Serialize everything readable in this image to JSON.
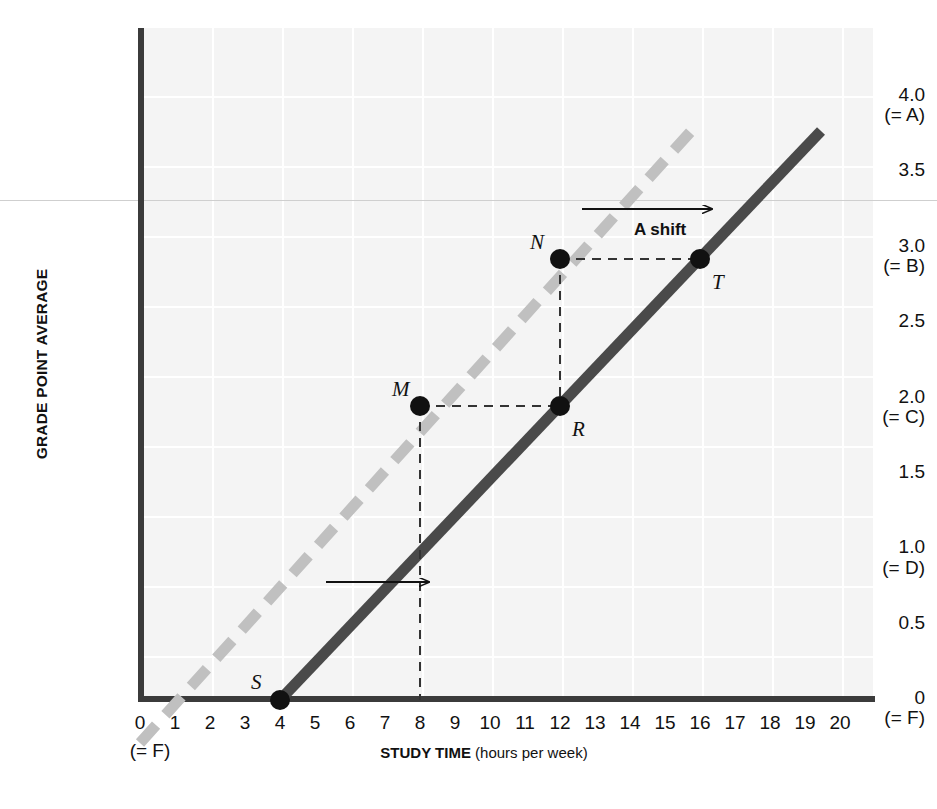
{
  "chart_data": {
    "type": "line",
    "title": "",
    "xlabel_strong": "STUDY TIME",
    "xlabel_rest": " (hours per week)",
    "ylabel": "GRADE POINT AVERAGE",
    "xlim": [
      0,
      21
    ],
    "ylim": [
      0,
      4.15
    ],
    "grid": true,
    "legend": "none",
    "x_ticks": [
      "0",
      "1",
      "2",
      "3",
      "4",
      "5",
      "6",
      "7",
      "8",
      "9",
      "10",
      "11",
      "12",
      "13",
      "14",
      "15",
      "16",
      "17",
      "18",
      "19",
      "20"
    ],
    "x_tick_sub": "(= F)",
    "y_ticks": [
      {
        "value": 4.0,
        "label": "4.0",
        "sub": "(= A)"
      },
      {
        "value": 3.5,
        "label": "3.5",
        "sub": ""
      },
      {
        "value": 3.0,
        "label": "3.0",
        "sub": "(= B)"
      },
      {
        "value": 2.5,
        "label": "2.5",
        "sub": ""
      },
      {
        "value": 2.0,
        "label": "2.0",
        "sub": "(= C)"
      },
      {
        "value": 1.5,
        "label": "1.5",
        "sub": ""
      },
      {
        "value": 1.0,
        "label": "1.0",
        "sub": "(= D)"
      },
      {
        "value": 0.5,
        "label": "0.5",
        "sub": ""
      },
      {
        "value": 0.0,
        "label": "0",
        "sub": "(= F)"
      }
    ],
    "series": [
      {
        "name": "original-curve",
        "style": "dashed",
        "color": "#c0c0c0",
        "x": [
          0.0,
          15.8
        ],
        "y": [
          -0.25,
          3.95
        ],
        "note": "original grade-study relationship, dashed light grey"
      },
      {
        "name": "shifted-curve",
        "style": "solid",
        "color": "#4a4a4a",
        "x": [
          4.0,
          20.0
        ],
        "y": [
          0.0,
          3.88
        ],
        "note": "shifted-right grade-study relationship, solid dark grey"
      }
    ],
    "points": [
      {
        "label": "M",
        "x": 8,
        "y": 1.93,
        "label_pos": "upper-left",
        "on": "original-curve"
      },
      {
        "label": "N",
        "x": 12,
        "y": 3.0,
        "label_pos": "upper-left",
        "on": "original-curve"
      },
      {
        "label": "R",
        "x": 12,
        "y": 1.93,
        "label_pos": "lower-right",
        "on": "shifted-curve"
      },
      {
        "label": "S",
        "x": 4,
        "y": 0.0,
        "label_pos": "upper-left",
        "on": "shifted-curve"
      },
      {
        "label": "T",
        "x": 16,
        "y": 3.0,
        "label_pos": "lower-right",
        "on": "shifted-curve"
      }
    ],
    "annotations": [
      {
        "name": "shift-label",
        "text": "A shift",
        "x": 14.2,
        "y": 3.3
      },
      {
        "name": "shift-arrow-upper",
        "from_x": 12.6,
        "from_y": 3.45,
        "to_x": 16.3,
        "to_y": 3.45
      },
      {
        "name": "shift-arrow-lower",
        "from_x": 5.3,
        "from_y": 0.78,
        "to_x": 8.2,
        "to_y": 0.78
      }
    ],
    "guide_lines": [
      {
        "name": "m-to-r-horizontal",
        "from_x": 8,
        "from_y": 1.93,
        "to_x": 12,
        "to_y": 1.93
      },
      {
        "name": "m-vertical-to-axis",
        "from_x": 8,
        "from_y": 1.93,
        "to_x": 8,
        "to_y": 0.0
      },
      {
        "name": "n-to-t-horizontal",
        "from_x": 12,
        "from_y": 3.0,
        "to_x": 16,
        "to_y": 3.0
      },
      {
        "name": "n-vertical-to-r",
        "from_x": 12,
        "from_y": 3.0,
        "to_x": 12,
        "to_y": 1.93
      }
    ],
    "colors": {
      "plot_background": "#f4f4f4",
      "gridline": "#ffffff",
      "axis": "#3b3b3b",
      "original_curve": "#c0c0c0",
      "shifted_curve": "#4a4a4a",
      "marker": "#111111",
      "guide": "#333333",
      "text": "#111111"
    }
  }
}
